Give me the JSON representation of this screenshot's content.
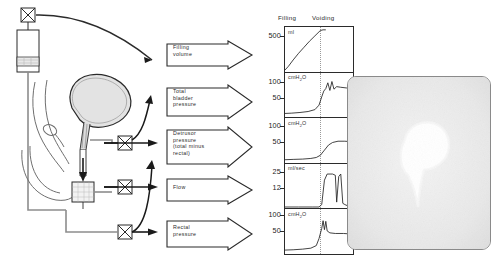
{
  "figure": {
    "domain": "urodynamics-study-diagram",
    "background": "#ffffff",
    "ink": "#1a1a1a"
  },
  "apparatus": {
    "name": "urodynamic-measurement-setup",
    "components": [
      {
        "id": "infusion-valve",
        "label": "",
        "icon": "x-box-valve-icon"
      },
      {
        "id": "infusion-reservoir",
        "label": "",
        "icon": "fluid-reservoir-icon"
      },
      {
        "id": "bladder",
        "label": "",
        "icon": "bladder-icon"
      },
      {
        "id": "urethra",
        "label": "",
        "icon": "urethra-icon"
      },
      {
        "id": "rectum",
        "label": "",
        "icon": "rectum-icon"
      },
      {
        "id": "flow-beaker",
        "label": "",
        "icon": "collection-beaker-icon"
      },
      {
        "id": "transducer-bladder",
        "label": "",
        "icon": "x-box-transducer-icon"
      },
      {
        "id": "transducer-flow",
        "label": "",
        "icon": "x-box-transducer-icon"
      },
      {
        "id": "transducer-rectal",
        "label": "",
        "icon": "x-box-transducer-icon"
      }
    ]
  },
  "callouts": [
    {
      "id": "filling-volume",
      "lines": [
        "Filling",
        "volume"
      ]
    },
    {
      "id": "total-bladder-pressure",
      "lines": [
        "Total",
        "bladder",
        "pressure"
      ]
    },
    {
      "id": "detrusor-pressure",
      "lines": [
        "Detrusor",
        "pressure",
        "(total  minus",
        "rectal)"
      ]
    },
    {
      "id": "flow",
      "lines": [
        "Flow"
      ]
    },
    {
      "id": "rectal-pressure",
      "lines": [
        "Rectal",
        "pressure"
      ]
    }
  ],
  "chart_data": {
    "type": "line",
    "title": "",
    "xlabel": "",
    "ylabel": "",
    "grid": false,
    "legend": "none",
    "phases": [
      "Filling",
      "Voiding"
    ],
    "phase_split_fraction": 0.52,
    "panels": [
      {
        "id": "filling-volume-trace",
        "unit": "ml",
        "unit_html": "ml",
        "ticks": [
          500
        ],
        "ylim": [
          0,
          620
        ],
        "series": [
          {
            "name": "filling volume",
            "x": [
              0,
              0.05,
              0.12,
              0.2,
              0.28,
              0.36,
              0.44,
              0.52,
              0.56,
              0.6
            ],
            "y": [
              0,
              55,
              150,
              250,
              340,
              430,
              510,
              590,
              600,
              600
            ]
          }
        ]
      },
      {
        "id": "total-bladder-pressure-trace",
        "unit": "cmH2O",
        "unit_html": "cmH<sub>2</sub>O",
        "ticks": [
          100,
          50
        ],
        "ylim": [
          0,
          130
        ],
        "series": [
          {
            "name": "total bladder pressure",
            "x": [
              0,
              0.1,
              0.22,
              0.34,
              0.44,
              0.5,
              0.54,
              0.57,
              0.6,
              0.63,
              0.66,
              0.69,
              0.72,
              0.76,
              0.82,
              0.9,
              1.0
            ],
            "y": [
              8,
              9,
              11,
              14,
              20,
              34,
              60,
              78,
              86,
              104,
              80,
              108,
              84,
              92,
              90,
              88,
              86
            ]
          }
        ]
      },
      {
        "id": "detrusor-pressure-trace",
        "unit": "cmH2O",
        "unit_html": "cmH<sub>2</sub>O",
        "ticks": [
          100,
          50
        ],
        "ylim": [
          0,
          130
        ],
        "series": [
          {
            "name": "detrusor pressure",
            "x": [
              0,
              0.12,
              0.26,
              0.38,
              0.46,
              0.52,
              0.58,
              0.64,
              0.7,
              0.78,
              0.88,
              1.0
            ],
            "y": [
              4,
              5,
              6,
              8,
              11,
              18,
              34,
              50,
              58,
              62,
              62,
              60
            ]
          }
        ]
      },
      {
        "id": "flow-trace",
        "unit": "ml/sec",
        "unit_html": "ml/sec",
        "ticks": [
          25,
          12
        ],
        "ylim": [
          0,
          34
        ],
        "series": [
          {
            "name": "urine flow rate",
            "x": [
              0,
              0.2,
              0.4,
              0.5,
              0.54,
              0.58,
              0.62,
              0.7,
              0.74,
              0.76,
              0.79,
              0.82,
              0.85,
              0.88,
              0.92,
              1.0
            ],
            "y": [
              0,
              0,
              0,
              0,
              2,
              22,
              27,
              27,
              26,
              4,
              25,
              27,
              3,
              2,
              1,
              0
            ]
          }
        ]
      },
      {
        "id": "rectal-pressure-trace",
        "unit": "cmH2O",
        "unit_html": "cmH<sub>2</sub>O",
        "ticks": [
          100,
          50
        ],
        "ylim": [
          0,
          130
        ],
        "series": [
          {
            "name": "rectal pressure",
            "x": [
              0,
              0.12,
              0.26,
              0.38,
              0.46,
              0.5,
              0.54,
              0.56,
              0.58,
              0.6,
              0.62,
              0.66,
              0.74,
              0.86,
              1.0
            ],
            "y": [
              6,
              7,
              9,
              12,
              20,
              42,
              74,
              98,
              70,
              96,
              66,
              60,
              58,
              58,
              56
            ]
          }
        ]
      }
    ]
  },
  "radiograph": {
    "id": "voiding-cystourethrogram",
    "caption": "",
    "background": "#ededed",
    "contrast_shape": "bladder-with-urethral-stream"
  }
}
